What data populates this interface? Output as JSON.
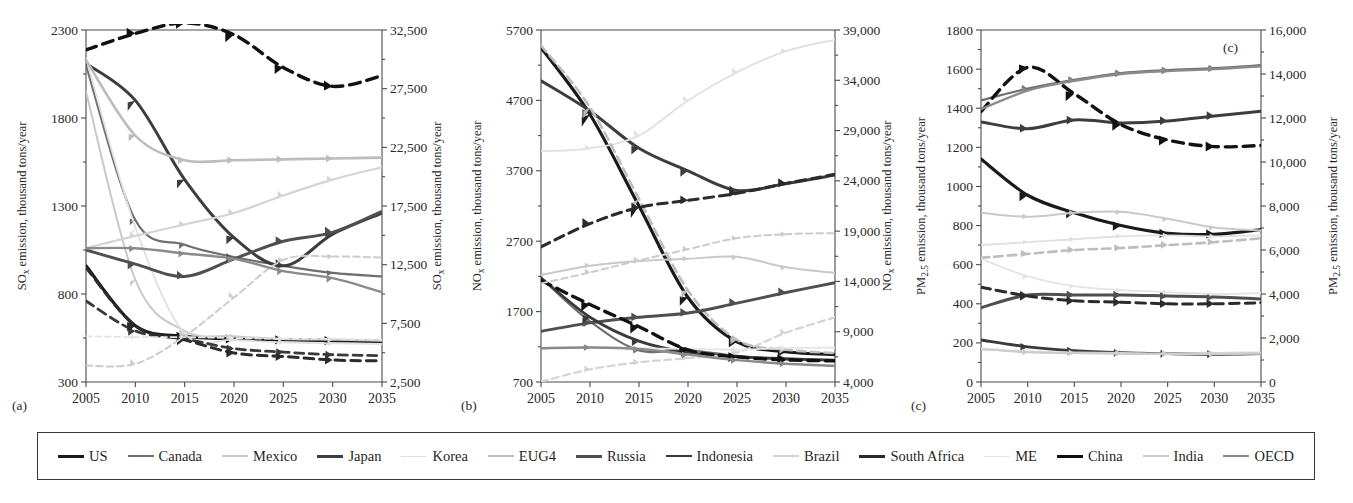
{
  "figure": {
    "background": "#ffffff",
    "panel_captions": [
      "(a)",
      "(b)",
      "(c)"
    ],
    "inner_caption_c": "(c)"
  },
  "legend": {
    "position": "bottom",
    "border_color": "#3a3a3a",
    "items": [
      {
        "label": "US",
        "color": "#1a1a1a",
        "width": 3.2,
        "dash": "none"
      },
      {
        "label": "Canada",
        "color": "#6e6e6e",
        "width": 2.2,
        "dash": "none"
      },
      {
        "label": "Mexico",
        "color": "#c9c9c9",
        "width": 2.0,
        "dash": "none"
      },
      {
        "label": "Japan",
        "color": "#3d3d3d",
        "width": 3.0,
        "dash": "none"
      },
      {
        "label": "Korea",
        "color": "#e0e0e0",
        "width": 1.8,
        "dash": "none"
      },
      {
        "label": "EUG4",
        "color": "#bdbdbd",
        "width": 2.6,
        "dash": "none"
      },
      {
        "label": "Russia",
        "color": "#4f4f4f",
        "width": 3.0,
        "dash": "none"
      },
      {
        "label": "Indonesia",
        "color": "#3a3a3a",
        "width": 2.8,
        "dash": "none"
      },
      {
        "label": "Brazil",
        "color": "#d4d4d4",
        "width": 2.2,
        "dash": "none"
      },
      {
        "label": "South Africa",
        "color": "#2b2b2b",
        "width": 3.0,
        "dash": "none"
      },
      {
        "label": "ME",
        "color": "#e4e4e4",
        "width": 1.8,
        "dash": "none"
      },
      {
        "label": "China",
        "color": "#111111",
        "width": 3.4,
        "dash": "none"
      },
      {
        "label": "India",
        "color": "#cccccc",
        "width": 2.0,
        "dash": "none"
      },
      {
        "label": "OECD",
        "color": "#8a8a8a",
        "width": 2.4,
        "dash": "none"
      }
    ]
  },
  "chart_data": [
    {
      "panel": "(a)",
      "type": "line",
      "title": "",
      "xlabel": "",
      "ylabel": "SO$_x$ emission, thousand tons/year",
      "ylabel_text": "SOx emission, thousand tons/year",
      "ylabel_right_text": "SOx emission, thousand tons/year",
      "x": [
        2005,
        2010,
        2015,
        2020,
        2025,
        2030,
        2035
      ],
      "xticks": [
        "2005",
        "2010",
        "2015",
        "2020",
        "2025",
        "2030",
        "2035"
      ],
      "xlim": [
        2005,
        2035
      ],
      "yticks_left": [
        300,
        800,
        1300,
        1800,
        2300
      ],
      "ylim_left": [
        300,
        2300
      ],
      "yticks_right": [
        2500,
        7500,
        12500,
        17500,
        22500,
        27500,
        32500
      ],
      "yticks_right_labels": [
        "2,500",
        "7,500",
        "12,500",
        "17,500",
        "22,500",
        "27,500",
        "32,500"
      ],
      "ylim_right": [
        2500,
        32500
      ],
      "grid": false,
      "series": [
        {
          "name": "US",
          "axis": "left",
          "dash": "none",
          "values": [
            960,
            620,
            560,
            545,
            540,
            535,
            530
          ]
        },
        {
          "name": "Canada",
          "axis": "left",
          "dash": "none",
          "values": [
            2100,
            1220,
            1080,
            1010,
            960,
            920,
            900
          ]
        },
        {
          "name": "Mexico",
          "axis": "left",
          "dash": "none",
          "values": [
            1950,
            880,
            590,
            560,
            545,
            540,
            535
          ]
        },
        {
          "name": "Japan",
          "axis": "left",
          "dash": "none",
          "values": [
            2110,
            1900,
            1450,
            1120,
            960,
            1140,
            1260
          ]
        },
        {
          "name": "Korea",
          "axis": "left",
          "dash": "none",
          "values": [
            2140,
            1180,
            575,
            540,
            525,
            520,
            515
          ]
        },
        {
          "name": "EUG4",
          "axis": "left",
          "dash": "none",
          "values": [
            2130,
            1700,
            1560,
            1560,
            1565,
            1570,
            1575
          ]
        },
        {
          "name": "Russia",
          "axis": "left",
          "dash": "none",
          "values": [
            1050,
            970,
            900,
            1000,
            1100,
            1150,
            1270
          ]
        },
        {
          "name": "Indonesia",
          "axis": "left",
          "dash": "dashed",
          "values": [
            760,
            590,
            545,
            490,
            470,
            455,
            450
          ]
        },
        {
          "name": "Brazil",
          "axis": "left",
          "dash": "none",
          "values": [
            1060,
            1130,
            1195,
            1260,
            1360,
            1450,
            1520
          ]
        },
        {
          "name": "South Africa",
          "axis": "left",
          "dash": "dashed",
          "values": [
            950,
            620,
            540,
            465,
            445,
            425,
            420
          ]
        },
        {
          "name": "ME",
          "axis": "left",
          "dash": "dashed",
          "values": [
            560,
            555,
            555,
            550,
            545,
            545,
            540
          ]
        },
        {
          "name": "China",
          "axis": "right",
          "dash": "dashed",
          "values": [
            30800,
            32200,
            33100,
            32100,
            29300,
            27700,
            28600
          ]
        },
        {
          "name": "India",
          "axis": "right",
          "dash": "dashed",
          "values": [
            3900,
            4050,
            6400,
            9700,
            12900,
            13200,
            13100
          ]
        },
        {
          "name": "OECD",
          "axis": "left",
          "dash": "none",
          "values": [
            1060,
            1060,
            1030,
            1000,
            930,
            890,
            810
          ]
        }
      ]
    },
    {
      "panel": "(b)",
      "type": "line",
      "title": "",
      "xlabel": "",
      "ylabel_text": "NOx emission, thousand tons/year",
      "ylabel_right_text": "NOx emission, thousand tons/year",
      "x": [
        2005,
        2010,
        2015,
        2020,
        2025,
        2030,
        2035
      ],
      "xticks": [
        "2005",
        "2010",
        "2015",
        "2020",
        "2025",
        "2030",
        "2035"
      ],
      "xlim": [
        2005,
        2035
      ],
      "yticks_left": [
        700,
        1700,
        2700,
        3700,
        4700,
        5700
      ],
      "ylim_left": [
        700,
        5700
      ],
      "yticks_right": [
        4000,
        9000,
        14000,
        19000,
        24000,
        29000,
        34000,
        39000
      ],
      "yticks_right_labels": [
        "4,000",
        "9,000",
        "14,000",
        "19,000",
        "24,000",
        "29,000",
        "34,000",
        "39,000"
      ],
      "ylim_right": [
        4000,
        39000
      ],
      "grid": false,
      "series": [
        {
          "name": "US",
          "axis": "left",
          "dash": "none",
          "values": [
            5450,
            4500,
            3200,
            1900,
            1270,
            1130,
            1090
          ]
        },
        {
          "name": "Canada",
          "axis": "left",
          "dash": "none",
          "values": [
            2180,
            1560,
            1150,
            1150,
            1070,
            1020,
            1010
          ]
        },
        {
          "name": "Mexico",
          "axis": "left",
          "dash": "none",
          "values": [
            2220,
            2350,
            2420,
            2450,
            2480,
            2330,
            2250
          ]
        },
        {
          "name": "Japan",
          "axis": "left",
          "dash": "none",
          "values": [
            4980,
            4550,
            4020,
            3700,
            3420,
            3520,
            3640
          ]
        },
        {
          "name": "Korea",
          "axis": "left",
          "dash": "none",
          "values": [
            3980,
            4020,
            4200,
            4700,
            5100,
            5400,
            5560
          ]
        },
        {
          "name": "EUG4",
          "axis": "left",
          "dash": "dashed",
          "values": [
            5480,
            4600,
            3300,
            2000,
            1300,
            1160,
            1110
          ]
        },
        {
          "name": "Russia",
          "axis": "left",
          "dash": "none",
          "values": [
            1420,
            1540,
            1620,
            1680,
            1820,
            1970,
            2110
          ]
        },
        {
          "name": "Indonesia",
          "axis": "left",
          "dash": "none",
          "values": [
            2180,
            1620,
            1280,
            1120,
            1060,
            1030,
            1010
          ]
        },
        {
          "name": "Brazil",
          "axis": "left",
          "dash": "dashed",
          "values": [
            705,
            880,
            980,
            1040,
            1120,
            1400,
            1620
          ]
        },
        {
          "name": "South Africa",
          "axis": "left",
          "dash": "dashed",
          "values": [
            2620,
            2950,
            3180,
            3280,
            3380,
            3520,
            3650
          ]
        },
        {
          "name": "ME",
          "axis": "left",
          "dash": "none",
          "values": [
            1180,
            1200,
            1180,
            1170,
            1160,
            1180,
            1190
          ]
        },
        {
          "name": "China",
          "axis": "right",
          "dash": "dashed",
          "values": [
            14100,
            11700,
            9500,
            7200,
            6500,
            6200,
            6100
          ]
        },
        {
          "name": "India",
          "axis": "right",
          "dash": "dashed",
          "values": [
            13800,
            14900,
            16100,
            17200,
            18300,
            18700,
            18800
          ]
        },
        {
          "name": "OECD",
          "axis": "left",
          "dash": "none",
          "values": [
            1180,
            1190,
            1170,
            1090,
            1010,
            960,
            930
          ]
        }
      ]
    },
    {
      "panel": "(c)",
      "type": "line",
      "title": "",
      "xlabel": "",
      "ylabel_text": "PM2.5 emission, thousand tons/year",
      "ylabel_right_text": "PM2.5 emission, thousand tons/year",
      "x": [
        2005,
        2010,
        2015,
        2020,
        2025,
        2030,
        2035
      ],
      "xticks": [
        "2005",
        "2010",
        "2015",
        "2020",
        "2025",
        "2030",
        "2035"
      ],
      "xlim": [
        2005,
        2035
      ],
      "yticks_left": [
        0,
        200,
        400,
        600,
        800,
        1000,
        1200,
        1400,
        1600,
        1800
      ],
      "ylim_left": [
        0,
        1800
      ],
      "yticks_right": [
        0,
        2000,
        4000,
        6000,
        8000,
        10000,
        12000,
        14000,
        16000
      ],
      "yticks_right_labels": [
        "0",
        "2,000",
        "4,000",
        "6,000",
        "8,000",
        "10,000",
        "12,000",
        "14,000",
        "16,000"
      ],
      "ylim_right": [
        0,
        16000
      ],
      "grid": false,
      "series": [
        {
          "name": "US",
          "axis": "left",
          "dash": "none",
          "values": [
            1140,
            955,
            865,
            800,
            760,
            755,
            780
          ]
        },
        {
          "name": "Canada",
          "axis": "left",
          "dash": "none",
          "values": [
            1440,
            1500,
            1545,
            1580,
            1595,
            1605,
            1620
          ]
        },
        {
          "name": "Mexico",
          "axis": "left",
          "dash": "none",
          "values": [
            865,
            845,
            865,
            870,
            835,
            790,
            775
          ]
        },
        {
          "name": "Japan",
          "axis": "left",
          "dash": "none",
          "values": [
            1330,
            1295,
            1340,
            1325,
            1335,
            1360,
            1385
          ]
        },
        {
          "name": "Korea",
          "axis": "left",
          "dash": "none",
          "values": [
            700,
            715,
            730,
            745,
            750,
            745,
            750
          ]
        },
        {
          "name": "EUG4",
          "axis": "left",
          "dash": "dashed",
          "values": [
            635,
            655,
            675,
            685,
            700,
            715,
            735
          ]
        },
        {
          "name": "Russia",
          "axis": "left",
          "dash": "none",
          "values": [
            380,
            445,
            445,
            445,
            440,
            435,
            425
          ]
        },
        {
          "name": "Indonesia",
          "axis": "left",
          "dash": "none",
          "values": [
            215,
            180,
            160,
            150,
            145,
            142,
            145
          ]
        },
        {
          "name": "Brazil",
          "axis": "left",
          "dash": "none",
          "values": [
            170,
            155,
            150,
            148,
            145,
            148,
            150
          ]
        },
        {
          "name": "South Africa",
          "axis": "left",
          "dash": "dashed",
          "values": [
            485,
            440,
            415,
            408,
            400,
            400,
            405
          ]
        },
        {
          "name": "ME",
          "axis": "left",
          "dash": "none",
          "values": [
            630,
            540,
            490,
            470,
            460,
            450,
            455
          ]
        },
        {
          "name": "China",
          "axis": "right",
          "dash": "dashed",
          "values": [
            12300,
            14300,
            13100,
            11700,
            11000,
            10700,
            10750
          ]
        },
        {
          "name": "India",
          "axis": "left",
          "dash": "none",
          "values": [
            168,
            152,
            148,
            145,
            143,
            143,
            145
          ]
        },
        {
          "name": "OECD",
          "axis": "left",
          "dash": "none",
          "values": [
            1395,
            1490,
            1540,
            1575,
            1590,
            1600,
            1615
          ]
        }
      ]
    }
  ]
}
